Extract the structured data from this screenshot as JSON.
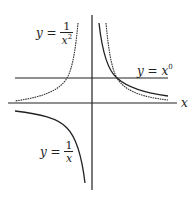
{
  "diagram": {
    "title": "",
    "axes": {
      "x_label": "x",
      "origin_px": [
        92,
        103
      ],
      "unit_px": 25
    },
    "labels": {
      "inv_x2": {
        "lhs": "y =",
        "num": "1",
        "den_base": "x",
        "den_exp": "2"
      },
      "x0": {
        "lhs": "y =",
        "base": "x",
        "exp": "0"
      },
      "inv_x": {
        "lhs": "y =",
        "num": "1",
        "den_base": "x"
      }
    },
    "curves": [
      {
        "name": "y = 1/x^2",
        "style": "dotted"
      },
      {
        "name": "y = x^0",
        "style": "solid-horizontal-line",
        "value": 1
      },
      {
        "name": "y = 1/x",
        "style": "solid"
      }
    ],
    "colors": {
      "ink": "#222222",
      "background": "#ffffff"
    }
  }
}
